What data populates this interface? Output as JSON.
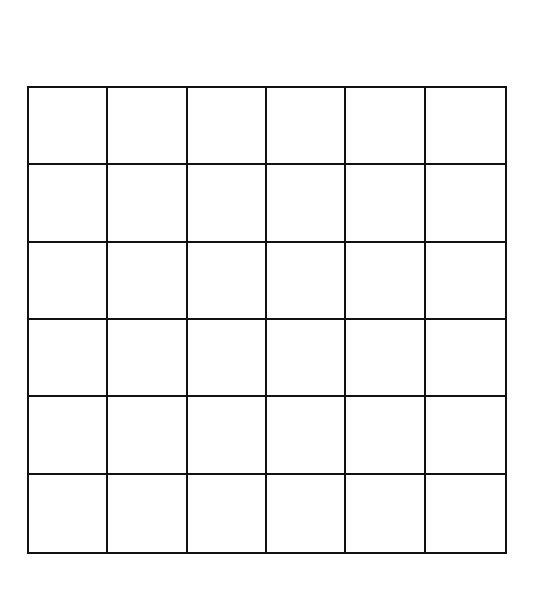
{
  "diagram": {
    "type": "grid",
    "rows": 6,
    "columns": 6,
    "line_color": "#111111",
    "background": "#ffffff"
  }
}
